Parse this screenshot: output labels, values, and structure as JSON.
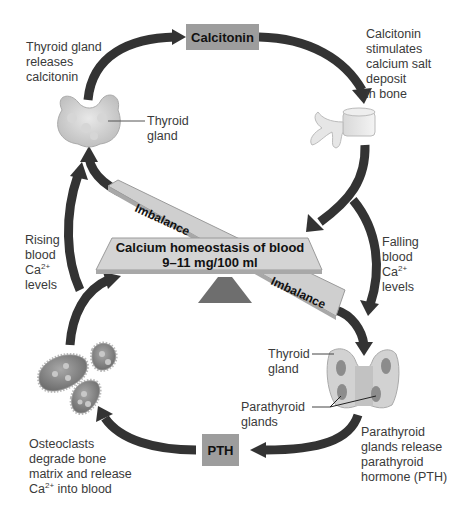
{
  "diagram": {
    "title": "Calcium homeostasis of blood",
    "center": {
      "line1": "Calcium homeostasis of blood",
      "line2": "9–11 mg/100 ml",
      "imbalance_top": "Imbalance",
      "imbalance_bottom": "Imbalance"
    },
    "hormones": {
      "top": "Calcitonin",
      "bottom": "PTH"
    },
    "labels": {
      "thyroid_releases": "Thyroid gland\nreleases\ncalcitonin",
      "thyroid_gland": "Thyroid\ngland",
      "calcitonin_stimulates": "Calcitonin\nstimulates\ncalcium salt\ndeposit\nin bone",
      "rising_1": "Rising\nblood",
      "rising_ca": "Ca",
      "rising_sup": "2+",
      "rising_2": "levels",
      "falling_1": "Falling\nblood",
      "falling_ca": "Ca",
      "falling_sup": "2+",
      "falling_2": "levels",
      "thyroid_gland_bottom": "Thyroid\ngland",
      "parathyroid_glands": "Parathyroid\nglands",
      "parathyroid_release": "Parathyroid\nglands release\nparathyroid\nhormone (PTH)",
      "osteoclasts_1": "Osteoclasts\ndegrade bone\nmatrix and release",
      "osteoclasts_ca": "Ca",
      "osteoclasts_sup": "2+",
      "osteoclasts_2": " into blood"
    },
    "colors": {
      "arrow": "#333333",
      "hormone_box": "#9d9d9d",
      "beam": "#d0d0d0",
      "fulcrum": "#6e6e6e",
      "text": "#3a3a3a"
    }
  }
}
